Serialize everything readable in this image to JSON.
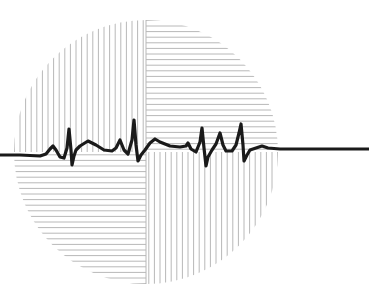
{
  "illustration": {
    "subject": "ecg-heartbeat-over-hatched-circle",
    "colors": {
      "background": "#ffffff",
      "hatch": "#b8b8b8",
      "trace": "#1a1a1a"
    },
    "circle": {
      "cx": 146,
      "cy": 152,
      "r": 132
    },
    "hatch_spacing": 5.6,
    "quadrants": [
      {
        "name": "top-left",
        "orientation": "vertical"
      },
      {
        "name": "top-right",
        "orientation": "horizontal"
      },
      {
        "name": "bottom-left",
        "orientation": "horizontal"
      },
      {
        "name": "bottom-right",
        "orientation": "vertical"
      }
    ],
    "trace_points": [
      [
        0,
        155
      ],
      [
        20,
        155
      ],
      [
        40,
        156
      ],
      [
        46,
        154
      ],
      [
        50,
        149
      ],
      [
        53,
        146
      ],
      [
        56,
        150
      ],
      [
        60,
        157
      ],
      [
        64,
        158
      ],
      [
        67,
        148
      ],
      [
        69,
        129
      ],
      [
        71,
        150
      ],
      [
        72,
        165
      ],
      [
        74,
        156
      ],
      [
        76,
        150
      ],
      [
        80,
        146
      ],
      [
        88,
        141
      ],
      [
        96,
        145
      ],
      [
        104,
        150
      ],
      [
        112,
        151
      ],
      [
        116,
        148
      ],
      [
        120,
        140
      ],
      [
        124,
        150
      ],
      [
        128,
        154
      ],
      [
        132,
        140
      ],
      [
        134,
        120
      ],
      [
        136,
        145
      ],
      [
        138,
        161
      ],
      [
        141,
        155
      ],
      [
        145,
        150
      ],
      [
        150,
        143
      ],
      [
        155,
        139
      ],
      [
        160,
        142
      ],
      [
        170,
        146
      ],
      [
        180,
        147
      ],
      [
        186,
        146
      ],
      [
        188,
        143
      ],
      [
        191,
        149
      ],
      [
        196,
        152
      ],
      [
        200,
        142
      ],
      [
        202,
        128
      ],
      [
        204,
        148
      ],
      [
        206,
        166
      ],
      [
        208,
        157
      ],
      [
        212,
        150
      ],
      [
        216,
        144
      ],
      [
        220,
        133
      ],
      [
        223,
        145
      ],
      [
        226,
        151
      ],
      [
        232,
        151
      ],
      [
        236,
        145
      ],
      [
        239,
        133
      ],
      [
        241,
        124
      ],
      [
        243,
        145
      ],
      [
        244,
        161
      ],
      [
        247,
        155
      ],
      [
        250,
        150
      ],
      [
        256,
        148
      ],
      [
        262,
        146
      ],
      [
        268,
        148
      ],
      [
        280,
        149
      ],
      [
        369,
        149
      ]
    ]
  }
}
